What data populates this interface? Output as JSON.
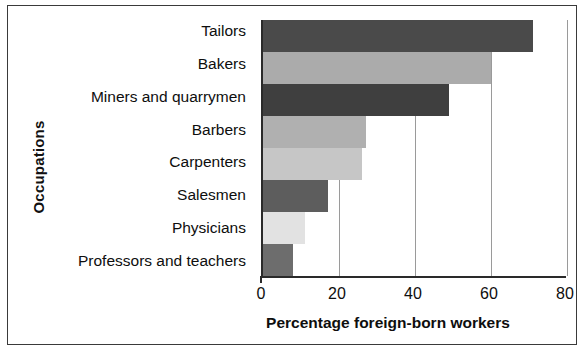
{
  "chart_data": {
    "type": "bar",
    "orientation": "horizontal",
    "title": "",
    "xlabel": "Percentage foreign-born workers",
    "ylabel": "Occupations",
    "categories": [
      "Tailors",
      "Bakers",
      "Miners and quarrymen",
      "Barbers",
      "Carpenters",
      "Salesmen",
      "Physicians",
      "Professors and teachers"
    ],
    "values": [
      71,
      60,
      49,
      27,
      26,
      17,
      11,
      8
    ],
    "xlim": [
      0,
      80
    ],
    "xticks": [
      0,
      20,
      40,
      60,
      80
    ],
    "xtick_labels": [
      "0",
      "20",
      "40",
      "60",
      "80"
    ],
    "grid": "vertical",
    "legend": "none",
    "bar_colors": [
      "#4a4a4a",
      "#ababab",
      "#3f3f3f",
      "#b0b0b0",
      "#c6c6c6",
      "#5d5d5d",
      "#e2e2e2",
      "#6d6d6d"
    ],
    "axis_color": "#2a2a2a",
    "gridline_color": "#9a9a9a",
    "frame_color": "#3a3a3a",
    "background": "#ffffff"
  }
}
